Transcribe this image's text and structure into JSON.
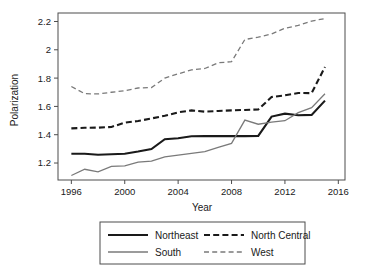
{
  "chart_data": {
    "type": "line",
    "title": "",
    "xlabel": "Year",
    "ylabel": "Polarization",
    "xlim": [
      1995,
      2016.5
    ],
    "ylim": [
      1.08,
      2.26
    ],
    "xticks": [
      1996,
      2000,
      2004,
      2008,
      2012,
      2016
    ],
    "xtick_labels": [
      "1996",
      "2000",
      "2004",
      "2008",
      "2012",
      "2016"
    ],
    "yticks": [
      1.2,
      1.4,
      1.6,
      1.8,
      2.0,
      2.2
    ],
    "ytick_labels": [
      "1.2",
      "1.4",
      "1.6",
      "1.8",
      "2",
      "2.2"
    ],
    "grid": false,
    "legend_position": "bottom",
    "x": [
      1996,
      1997,
      1998,
      1999,
      2000,
      2001,
      2002,
      2003,
      2004,
      2005,
      2006,
      2007,
      2008,
      2009,
      2010,
      2011,
      2012,
      2013,
      2014,
      2015
    ],
    "series": [
      {
        "name": "Northeast",
        "style": "solid",
        "color": "#1a1a1a",
        "width": 2.1,
        "values": [
          1.265,
          1.265,
          1.258,
          1.262,
          1.266,
          1.281,
          1.299,
          1.368,
          1.375,
          1.389,
          1.39,
          1.39,
          1.39,
          1.39,
          1.392,
          1.528,
          1.549,
          1.538,
          1.54,
          1.641
        ]
      },
      {
        "name": "South",
        "style": "solid",
        "color": "#7a7a7a",
        "width": 1.3,
        "values": [
          1.112,
          1.156,
          1.138,
          1.176,
          1.18,
          1.207,
          1.214,
          1.243,
          1.256,
          1.268,
          1.281,
          1.31,
          1.339,
          1.503,
          1.474,
          1.489,
          1.499,
          1.556,
          1.591,
          1.689
        ]
      },
      {
        "name": "North Central",
        "style": "dashed-thick",
        "color": "#1a1a1a",
        "width": 2.1,
        "values": [
          1.445,
          1.449,
          1.45,
          1.455,
          1.485,
          1.497,
          1.515,
          1.534,
          1.558,
          1.572,
          1.563,
          1.568,
          1.572,
          1.575,
          1.578,
          1.666,
          1.678,
          1.695,
          1.694,
          1.879
        ]
      },
      {
        "name": "West",
        "style": "dashed-thin",
        "color": "#7a7a7a",
        "width": 1.3,
        "values": [
          1.741,
          1.69,
          1.688,
          1.7,
          1.711,
          1.73,
          1.733,
          1.8,
          1.83,
          1.858,
          1.868,
          1.908,
          1.916,
          2.073,
          2.089,
          2.112,
          2.152,
          2.172,
          2.203,
          2.221
        ]
      }
    ]
  },
  "legend": {
    "entries": [
      {
        "label": "Northeast"
      },
      {
        "label": "North Central"
      },
      {
        "label": "South"
      },
      {
        "label": "West"
      }
    ]
  }
}
